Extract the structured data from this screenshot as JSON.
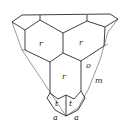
{
  "diagram": {
    "type": "crystal-face-drawing",
    "labels": {
      "r_left": "r",
      "r_right": "r",
      "r_bottom": "r",
      "o": "o",
      "m": "m",
      "t_left": "t",
      "t_right": "t",
      "a_left": "a",
      "a_right": "a"
    }
  }
}
